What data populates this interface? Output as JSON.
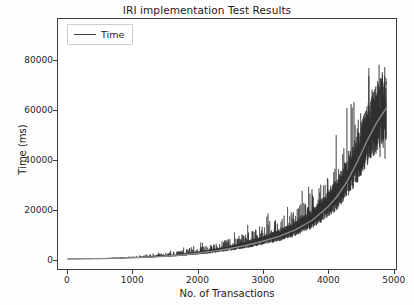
{
  "chart_data": {
    "type": "line",
    "title": "IRI implementation Test Results",
    "xlabel": "No. of Transactions",
    "ylabel": "Time (ms)",
    "xlim": [
      -150,
      5050
    ],
    "ylim": [
      -4000,
      97000
    ],
    "xticks": [
      0,
      1000,
      2000,
      3000,
      4000,
      5000
    ],
    "xtick_labels": [
      "0",
      "1000",
      "2000",
      "3000",
      "4000",
      "5000"
    ],
    "yticks": [
      0,
      20000,
      40000,
      60000,
      80000
    ],
    "ytick_labels": [
      "0",
      "20000",
      "40000",
      "60000",
      "80000"
    ],
    "grid": false,
    "legend": {
      "position": "upper left",
      "entries": [
        {
          "name": "Time",
          "color": "#3f3f3f"
        }
      ]
    },
    "series": [
      {
        "name": "Time",
        "color": "#2f2f2f",
        "description": "Noisy per-transaction latency: baseline grows roughly exponentially from ~50 ms at 0 transactions to ~60000 ms near 4900 transactions, with dense high-frequency spikes that widen with x and peak around 93000 ms near 4600 transactions.",
        "trend_x": [
          0,
          250,
          500,
          750,
          1000,
          1250,
          1500,
          1750,
          2000,
          2250,
          2500,
          2750,
          3000,
          3250,
          3500,
          3750,
          4000,
          4150,
          4300,
          4450,
          4600,
          4750,
          4900
        ],
        "trend_y": [
          60,
          120,
          200,
          320,
          520,
          780,
          1150,
          1650,
          2350,
          3200,
          4300,
          5600,
          7200,
          9200,
          11800,
          15500,
          21000,
          25500,
          31500,
          39000,
          47500,
          55000,
          61000
        ],
        "noise_envelope_x": [
          0,
          500,
          1000,
          1500,
          2000,
          2500,
          3000,
          3500,
          4000,
          4300,
          4600,
          4900
        ],
        "noise_envelope_high": [
          150,
          500,
          1300,
          3000,
          6200,
          11000,
          17000,
          26000,
          45000,
          62000,
          93000,
          84000
        ],
        "noise_envelope_low": [
          30,
          90,
          300,
          700,
          1400,
          2500,
          4000,
          6500,
          11000,
          14000,
          16000,
          19000
        ],
        "n_points": 4900
      }
    ]
  },
  "figure": {
    "background": "#fdfdfd",
    "plot_background": "#ffffff",
    "axis_color": "#3a3a3a"
  }
}
